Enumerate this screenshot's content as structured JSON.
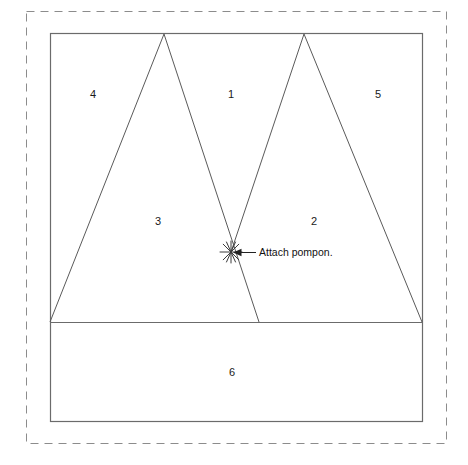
{
  "diagram": {
    "canvas": {
      "width": 468,
      "height": 465,
      "background": "#ffffff"
    },
    "colors": {
      "fabric_outline": "#6b6b6b",
      "cut_line": "#5a5a5a",
      "seam_allowance_dashed": "#8c8c8c",
      "label_text": "#1a1a1a",
      "callout_text": "#111111",
      "marker": "#3a3a3a"
    },
    "seam_allowance_border": {
      "shape": "dashed-rectangle",
      "x": 26,
      "y": 11,
      "width": 420,
      "height": 432,
      "dash_pattern": "8 6",
      "stroke_width": 1
    },
    "fabric_rectangle": {
      "shape": "rectangle",
      "x": 50,
      "y": 33,
      "width": 372,
      "height": 388,
      "stroke_width": 1.2
    },
    "baseline": {
      "shape": "horizontal-line",
      "x1": 50,
      "y1": 322,
      "x2": 422,
      "y2": 322
    },
    "triangles": [
      {
        "name": "left-triangle",
        "apex": {
          "x": 164,
          "y": 34
        },
        "base_left": {
          "x": 50,
          "y": 322
        },
        "base_right": {
          "x": 259,
          "y": 322
        }
      },
      {
        "name": "right-triangle",
        "apex": {
          "x": 304,
          "y": 34
        },
        "base_left": {
          "x": 231,
          "y": 252
        },
        "base_right": {
          "x": 422,
          "y": 322
        }
      }
    ],
    "piece_labels": [
      {
        "id": "label-1",
        "text": "1",
        "x": 231,
        "y": 95
      },
      {
        "id": "label-2",
        "text": "2",
        "x": 314,
        "y": 222
      },
      {
        "id": "label-3",
        "text": "3",
        "x": 158,
        "y": 222
      },
      {
        "id": "label-4",
        "text": "4",
        "x": 93,
        "y": 95
      },
      {
        "id": "label-5",
        "text": "5",
        "x": 378,
        "y": 95
      },
      {
        "id": "label-6",
        "text": "6",
        "x": 232,
        "y": 373
      }
    ],
    "callout": {
      "text": "Attach pompon.",
      "text_x": 258,
      "text_y": 253,
      "marker": {
        "type": "star-marker",
        "x": 231,
        "y": 252,
        "radius": 11,
        "rays": 8
      },
      "leader_line": {
        "x1": 254,
        "y1": 252,
        "x2": 238,
        "y2": 252
      },
      "arrow_head": {
        "x": 234,
        "y": 252,
        "size": 6,
        "direction": "left"
      }
    }
  }
}
